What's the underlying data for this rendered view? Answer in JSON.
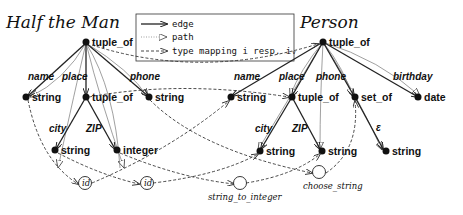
{
  "graphs": {
    "left": {
      "title": "Half the Man",
      "root": "tuple_of",
      "edges": {
        "name": "name",
        "place": "place",
        "phone": "phone",
        "city": "city",
        "zip": "ZIP"
      },
      "nodes": {
        "name_type": "string",
        "place_type": "tuple_of",
        "phone_type": "string",
        "city_type": "string",
        "zip_type": "integer"
      }
    },
    "right": {
      "title": "Person",
      "root": "tuple_of",
      "edges": {
        "name": "name",
        "place": "place",
        "phone": "phone",
        "birthday": "birthday",
        "city": "city",
        "zip": "ZIP",
        "element": "ε"
      },
      "nodes": {
        "name_type": "string",
        "place_type": "tuple_of",
        "phone_type": "set_of",
        "birthday_type": "date",
        "city_type": "string",
        "zip_type": "string",
        "element_type": "string"
      }
    }
  },
  "legend": {
    "items": [
      {
        "style": "solid-arrow",
        "label": "edge"
      },
      {
        "style": "dotted-hollow-arrow",
        "label": "path"
      },
      {
        "style": "dashed-arrow",
        "label": "type mapping i resp. iᵥ"
      }
    ]
  },
  "functions": {
    "id1": "id",
    "id2": "id",
    "string_to_integer": "string_to_integer",
    "choose_string": "choose_string"
  }
}
